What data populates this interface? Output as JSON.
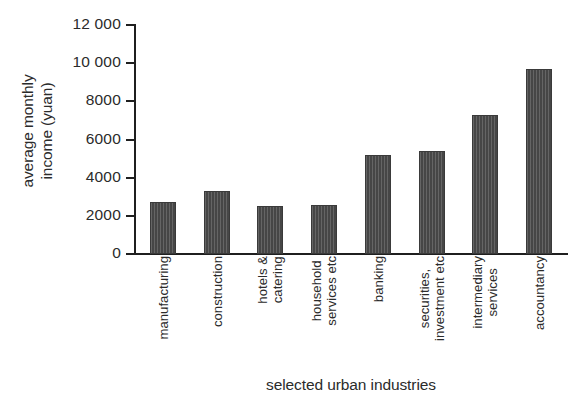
{
  "chart_data": {
    "type": "bar",
    "title": "",
    "xlabel": "selected urban industries",
    "ylabel": "average monthly income (yuan)",
    "ylabel_lines": [
      "average monthly",
      "income (yuan)"
    ],
    "categories": [
      "manufacturing",
      "construction",
      "hotels & catering",
      "household services etc",
      "banking",
      "securities, investment etc",
      "intermediary services",
      "accountancy"
    ],
    "category_lines": [
      [
        "manufacturing"
      ],
      [
        "construction"
      ],
      [
        "hotels &",
        "catering"
      ],
      [
        "household",
        "services etc"
      ],
      [
        "banking"
      ],
      [
        "securities,",
        "investment etc"
      ],
      [
        "intermediary",
        "services"
      ],
      [
        "accountancy"
      ]
    ],
    "values": [
      2700,
      3300,
      2500,
      2550,
      5200,
      5400,
      7300,
      9700
    ],
    "ylim": [
      0,
      12000
    ],
    "yticks": [
      0,
      2000,
      4000,
      6000,
      8000,
      10000,
      12000
    ],
    "ytick_labels": [
      "0",
      "2000",
      "4000",
      "6000",
      "8000",
      "10 000",
      "12 000"
    ],
    "grid": false,
    "legend": null,
    "bar_color": "#4e4e4e",
    "axis_color": "#1f1f1f",
    "text_color": "#2b2b2b",
    "background": "#ffffff"
  }
}
